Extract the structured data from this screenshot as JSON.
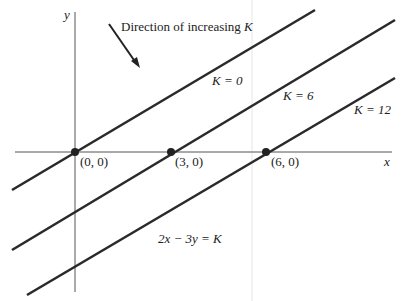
{
  "axes": {
    "x_label": "x",
    "y_label": "y"
  },
  "direction_label_pre": "Direction of increasing ",
  "direction_label_var": "K",
  "lines": [
    {
      "k_label": "K = 0",
      "point_label": "(0, 0)"
    },
    {
      "k_label": "K = 6",
      "point_label": "(3, 0)"
    },
    {
      "k_label": "K = 12",
      "point_label": "(6, 0)"
    }
  ],
  "equation": "2x − 3y = K",
  "colors": {
    "line": "#2a2a2a",
    "axis": "#555555"
  }
}
